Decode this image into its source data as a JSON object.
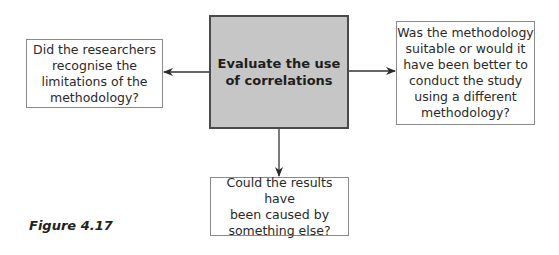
{
  "diagram": {
    "center": {
      "text": "Evaluate the use of correlations",
      "lines": [
        "Evaluate the use",
        "of correlations"
      ],
      "fill": "#c6c6c6"
    },
    "left": {
      "lines": [
        "Did the researchers",
        "recognise the",
        "limitations of the",
        "methodology?"
      ]
    },
    "right": {
      "lines": [
        "Was the methodology",
        "suitable or would it",
        "have been better to",
        "conduct the study",
        "using a different",
        "methodology?"
      ]
    },
    "bottom": {
      "lines": [
        "Could the results have",
        "been caused by",
        "something else?"
      ]
    },
    "edges": [
      {
        "from": "center",
        "to": "left"
      },
      {
        "from": "center",
        "to": "right"
      },
      {
        "from": "center",
        "to": "bottom"
      }
    ]
  },
  "caption": "Figure 4.17"
}
